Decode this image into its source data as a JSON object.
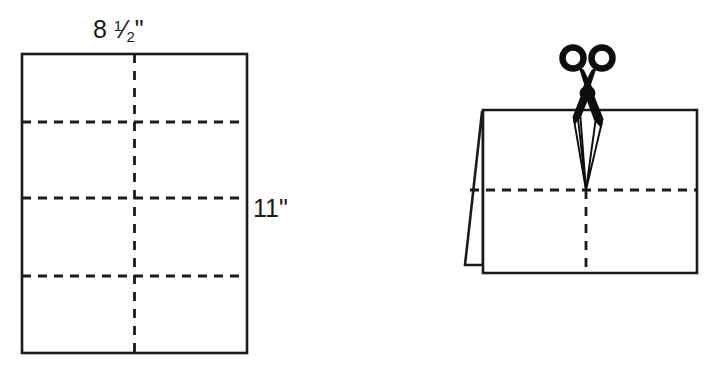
{
  "figure": {
    "background_color": "#ffffff",
    "line_color": "#1a1a1a",
    "scissors_color": "#0d0d0d"
  },
  "left_diagram": {
    "name": "flat-sheet-of-paper",
    "description": "Unfolded portrait sheet with dashed fold lines",
    "width_label": "8 ½\"",
    "width_label_whole": "8",
    "width_label_fraction_numerator": "1",
    "width_label_fraction_denominator": "2",
    "width_label_unit": "\"",
    "height_label": "11\"",
    "horizontal_fold_count": 3,
    "vertical_fold_count": 1
  },
  "right_diagram": {
    "name": "folded-paper-being-cut",
    "description": "Paper folded in half standing like a tent, scissors cutting down the center fold",
    "scissors_label": "scissors",
    "horizontal_fold_count": 1,
    "vertical_fold_count": 1
  }
}
